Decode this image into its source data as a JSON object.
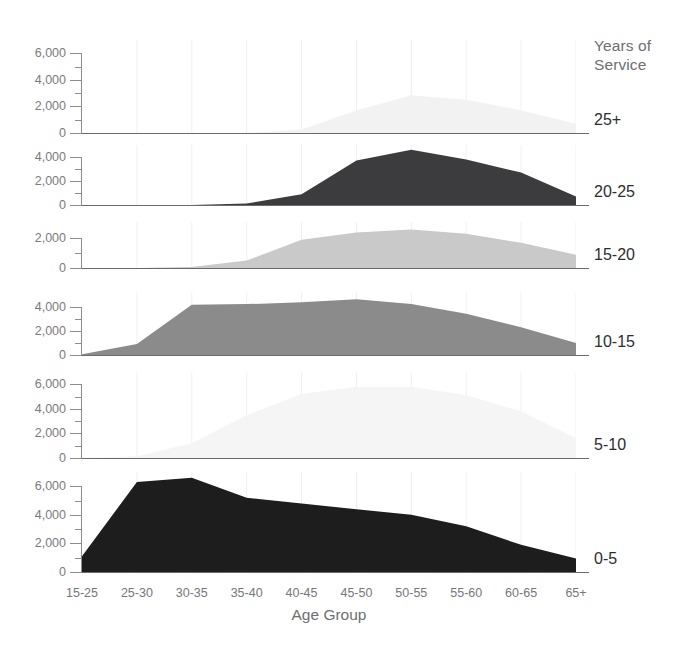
{
  "legend": {
    "title": "Years of\nService"
  },
  "axis": {
    "x_title": "Age Group",
    "x_categories": [
      "15-25",
      "25-30",
      "30-35",
      "35-40",
      "40-45",
      "45-50",
      "50-55",
      "55-60",
      "60-65",
      "65+"
    ]
  },
  "chart_data": {
    "type": "area",
    "title": "",
    "xlabel": "Age Group",
    "ylabel": "",
    "legend_title": "Years of Service",
    "legend_position": "right",
    "grid": true,
    "layout": "small-multiples-vertical",
    "categories": [
      "15-25",
      "25-30",
      "30-35",
      "35-40",
      "40-45",
      "45-50",
      "50-55",
      "55-60",
      "60-65",
      "65+"
    ],
    "series": [
      {
        "name": "25+",
        "values": [
          0,
          0,
          0,
          0,
          260,
          1700,
          2850,
          2500,
          1700,
          700
        ],
        "ylim": [
          0,
          7000
        ],
        "yticks": [
          0,
          2000,
          4000,
          6000
        ],
        "ytick_labels": [
          "0",
          "2,000",
          "4,000",
          "6,000"
        ],
        "color": "#f2f2f2"
      },
      {
        "name": "20-25",
        "values": [
          0,
          0,
          0,
          120,
          900,
          3700,
          4600,
          3800,
          2700,
          700
        ],
        "ylim": [
          0,
          5000
        ],
        "yticks": [
          0,
          2000,
          4000
        ],
        "ytick_labels": [
          "0",
          "2,000",
          "4,000"
        ],
        "color": "#3c3c3e"
      },
      {
        "name": "15-20",
        "values": [
          0,
          0,
          60,
          500,
          1900,
          2400,
          2600,
          2300,
          1700,
          900
        ],
        "ylim": [
          0,
          3100
        ],
        "yticks": [
          0,
          2000
        ],
        "ytick_labels": [
          "0",
          "2,000"
        ],
        "color": "#c9c9c9"
      },
      {
        "name": "10-15",
        "values": [
          60,
          900,
          4150,
          4200,
          4350,
          4600,
          4200,
          3400,
          2300,
          1000
        ],
        "ylim": [
          0,
          5200
        ],
        "yticks": [
          0,
          2000,
          4000
        ],
        "ytick_labels": [
          "0",
          "2,000",
          "4,000"
        ],
        "color": "#8b8b8b"
      },
      {
        "name": "5-10",
        "values": [
          0,
          150,
          1200,
          3500,
          5200,
          5800,
          5800,
          5100,
          3800,
          1600
        ],
        "ylim": [
          0,
          7000
        ],
        "yticks": [
          0,
          2000,
          4000,
          6000
        ],
        "ytick_labels": [
          "0",
          "2,000",
          "4,000",
          "6,000"
        ],
        "color": "#f5f5f5"
      },
      {
        "name": "0-5",
        "values": [
          1100,
          6300,
          6600,
          5200,
          4800,
          4400,
          4000,
          3200,
          1900,
          950
        ],
        "ylim": [
          0,
          7000
        ],
        "yticks": [
          0,
          2000,
          4000,
          6000
        ],
        "ytick_labels": [
          "0",
          "2,000",
          "4,000",
          "6,000"
        ],
        "color": "#1d1d1d"
      }
    ]
  }
}
